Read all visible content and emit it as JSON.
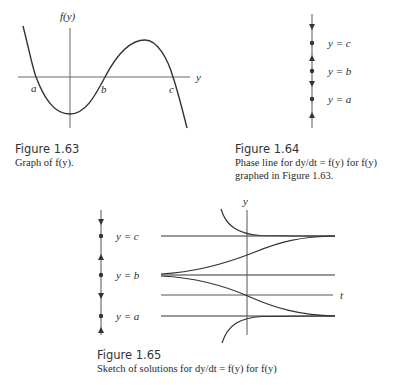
{
  "figures": [
    {
      "id": "fig-1-63",
      "number": "Figure 1.63",
      "caption_lines": [
        "Graph of f(y)."
      ],
      "axis_labels": {
        "vertical": "f(y)",
        "horizontal": "y"
      },
      "root_labels": [
        "a",
        "b",
        "c"
      ]
    },
    {
      "id": "fig-1-64",
      "number": "Figure 1.64",
      "caption_lines": [
        "Phase line for dy/dt = f(y) for f(y)",
        "graphed in Figure 1.63."
      ],
      "equilibrium_labels": [
        "y = c",
        "y = b",
        "y = a"
      ],
      "arrows": [
        "down",
        "up",
        "down",
        "up"
      ]
    },
    {
      "id": "fig-1-65",
      "number": "Figure 1.65",
      "caption_lines": [
        "Sketch of solutions for dy/dt = f(y) for f(y)"
      ],
      "axis_labels": {
        "vertical": "y",
        "horizontal": "t"
      },
      "equilibrium_labels": [
        "y = c",
        "y = b",
        "y = a"
      ],
      "arrows": [
        "down",
        "up",
        "down",
        "up"
      ]
    }
  ],
  "colors": {
    "ink": "#2a2a2a",
    "axis": "#555555",
    "background": "#ffffff"
  }
}
